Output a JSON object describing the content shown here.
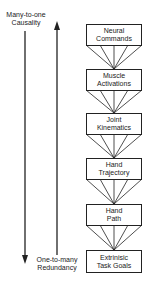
{
  "diagram": {
    "top_label": {
      "line1": "Many-to-one",
      "line2": "Causality"
    },
    "bottom_label": {
      "line1": "One-to-many",
      "line2": "Redundancy"
    },
    "boxes": [
      {
        "line1": "Neural",
        "line2": "Commands"
      },
      {
        "line1": "Muscle",
        "line2": "Activations"
      },
      {
        "line1": "Joint",
        "line2": "Kinematics"
      },
      {
        "line1": "Hand",
        "line2": "Trajectory"
      },
      {
        "line1": "Hand",
        "line2": "Path"
      },
      {
        "line1": "Extrinisic",
        "line2": "Task Goals"
      }
    ],
    "arrows": [
      {
        "name": "downward-arrow",
        "direction": "down",
        "meaning": "Many-to-one Causality to One-to-many Redundancy"
      },
      {
        "name": "upward-arrow",
        "direction": "up"
      }
    ],
    "colors": {
      "line": "#222222",
      "background": "#ffffff",
      "text": "#1a1a1a"
    }
  }
}
